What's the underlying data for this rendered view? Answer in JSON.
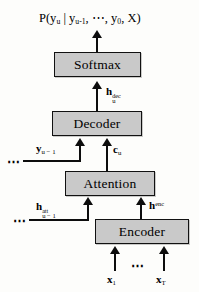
{
  "figure": {
    "type": "neural-network-block-diagram",
    "title_formula": "P(y_u | y_u-1, ..., y_0, X)",
    "background_color": "#fdfdfb",
    "node_fill_color": "#c9c9c9",
    "node_border_color": "#111111",
    "line_color": "#0d0d0d"
  },
  "output": {
    "p_open": "P(y",
    "p_sub": "u",
    "bar": " | y",
    "bar_sub": "u-1",
    "ellipsis": ", ⋯, y",
    "zero_sub": "0",
    "tail": ", X)"
  },
  "nodes": [
    {
      "id": "softmax",
      "label": "Softmax"
    },
    {
      "id": "decoder",
      "label": "Decoder"
    },
    {
      "id": "attention",
      "label": "Attention"
    },
    {
      "id": "encoder",
      "label": "Encoder"
    }
  ],
  "signals": {
    "h_dec": {
      "base": "h",
      "sup": "dec",
      "sub": "u"
    },
    "c_u": {
      "base": "c",
      "sub": "u"
    },
    "y_prev": {
      "base": "y",
      "sub": "u − 1"
    },
    "h_att": {
      "base": "h",
      "sup": "att",
      "sub": "u − 1"
    },
    "h_enc": {
      "base": "h",
      "sup": "enc"
    },
    "x_1": {
      "base": "x",
      "sub": "1"
    },
    "x_T": {
      "base": "x",
      "sub": "T"
    }
  },
  "ellipses": {
    "recurrent_y": "⋯",
    "recurrent_h": "⋯",
    "inputs": "⋯"
  }
}
